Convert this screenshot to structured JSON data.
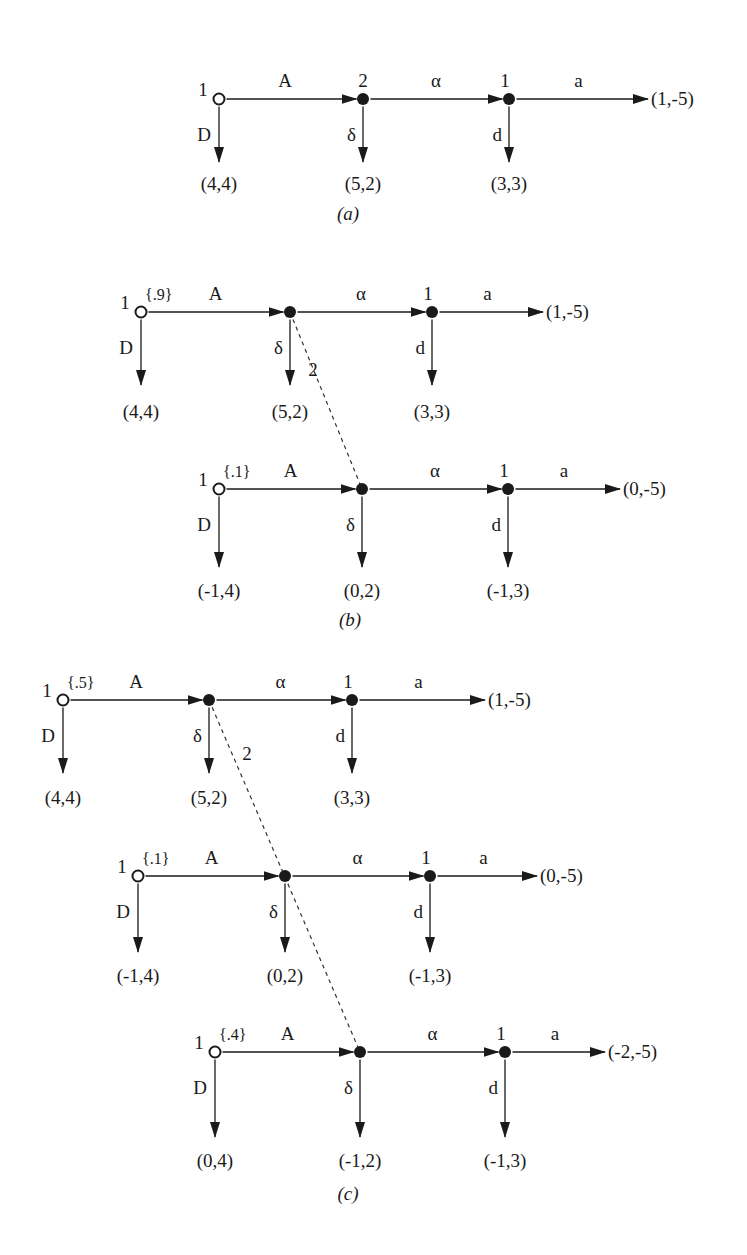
{
  "colors": {
    "ink": "#1a1a1a",
    "background": "#ffffff",
    "dashed_info_set": "#333333"
  },
  "figures": [
    {
      "id": "a",
      "caption": "(a)",
      "caption_pos": [
        348,
        220
      ],
      "info_set_dash": null,
      "info_set_label": null,
      "trees": [
        {
          "root": [
            219,
            99
          ],
          "player_label": "1",
          "prior": null,
          "node2": [
            363,
            99
          ],
          "node2_label": "2",
          "node3": [
            509,
            99
          ],
          "node3_label": "1",
          "end_x": 648,
          "drop_y": 162,
          "pay_y": 190,
          "moves": {
            "A": "A",
            "alpha": "α",
            "a": "a",
            "D": "D",
            "delta": "δ",
            "d": "d"
          },
          "payoffs": {
            "D": "(4,4)",
            "delta": "(5,2)",
            "d": "(3,3)",
            "a": "(1,-5)"
          }
        }
      ]
    },
    {
      "id": "b",
      "caption": "(b)",
      "caption_pos": [
        350,
        626
      ],
      "info_set_dash": [
        [
          290,
          312
        ],
        [
          362,
          489
        ]
      ],
      "info_set_label": {
        "text": "2",
        "pos": [
          313,
          376
        ]
      },
      "trees": [
        {
          "root": [
            141,
            312
          ],
          "player_label": "1",
          "prior": "{.9}",
          "node2": [
            290,
            312
          ],
          "node2_label": "",
          "node3": [
            432,
            312
          ],
          "node3_label": "1",
          "end_x": 543,
          "drop_y": 385,
          "pay_y": 418,
          "moves": {
            "A": "A",
            "alpha": "α",
            "a": "a",
            "D": "D",
            "delta": "δ",
            "d": "d"
          },
          "payoffs": {
            "D": "(4,4)",
            "delta": "(5,2)",
            "d": "(3,3)",
            "a": "(1,-5)"
          }
        },
        {
          "root": [
            219,
            489
          ],
          "player_label": "1",
          "prior": "{.1}",
          "node2": [
            362,
            489
          ],
          "node2_label": "",
          "node3": [
            508,
            489
          ],
          "node3_label": "1",
          "end_x": 620,
          "drop_y": 567,
          "pay_y": 597,
          "moves": {
            "A": "A",
            "alpha": "α",
            "a": "a",
            "D": "D",
            "delta": "δ",
            "d": "d"
          },
          "payoffs": {
            "D": "(-1,4)",
            "delta": "(0,2)",
            "d": "(-1,3)",
            "a": "(0,-5)"
          }
        }
      ]
    },
    {
      "id": "c",
      "caption": "(c)",
      "caption_pos": [
        348,
        1200
      ],
      "info_set_dash": [
        [
          209,
          700
        ],
        [
          360,
          1052
        ]
      ],
      "info_set_label": {
        "text": "2",
        "pos": [
          247,
          760
        ]
      },
      "trees": [
        {
          "root": [
            63,
            700
          ],
          "player_label": "1",
          "prior": "{.5}",
          "node2": [
            209,
            700
          ],
          "node2_label": "",
          "node3": [
            352,
            700
          ],
          "node3_label": "1",
          "end_x": 485,
          "drop_y": 773,
          "pay_y": 804,
          "moves": {
            "A": "A",
            "alpha": "α",
            "a": "a",
            "D": "D",
            "delta": "δ",
            "d": "d"
          },
          "payoffs": {
            "D": "(4,4)",
            "delta": "(5,2)",
            "d": "(3,3)",
            "a": "(1,-5)"
          }
        },
        {
          "root": [
            138,
            876
          ],
          "player_label": "1",
          "prior": "{.1}",
          "node2": [
            285,
            876
          ],
          "node2_label": "",
          "node3": [
            430,
            876
          ],
          "node3_label": "1",
          "end_x": 537,
          "drop_y": 952,
          "pay_y": 982,
          "moves": {
            "A": "A",
            "alpha": "α",
            "a": "a",
            "D": "D",
            "delta": "δ",
            "d": "d"
          },
          "payoffs": {
            "D": "(-1,4)",
            "delta": "(0,2)",
            "d": "(-1,3)",
            "a": "(0,-5)"
          }
        },
        {
          "root": [
            215,
            1052
          ],
          "player_label": "1",
          "prior": "{.4}",
          "node2": [
            360,
            1052
          ],
          "node2_label": "",
          "node3": [
            505,
            1052
          ],
          "node3_label": "1",
          "end_x": 605,
          "drop_y": 1137,
          "pay_y": 1167,
          "moves": {
            "A": "A",
            "alpha": "α",
            "a": "a",
            "D": "D",
            "delta": "δ",
            "d": "d"
          },
          "payoffs": {
            "D": "(0,4)",
            "delta": "(-1,2)",
            "d": "(-1,3)",
            "a": "(-2,-5)"
          }
        }
      ]
    }
  ]
}
